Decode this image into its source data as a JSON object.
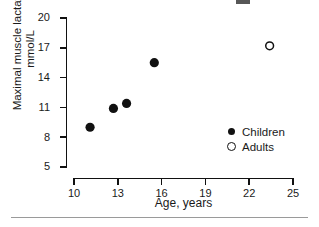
{
  "chart_data": {
    "type": "scatter",
    "title": "",
    "xlabel": "Age, years",
    "ylabel": "Maximal muscle lactate, mmol/L",
    "xlim": [
      10,
      25
    ],
    "ylim": [
      5,
      20
    ],
    "xticks": [
      10,
      13,
      16,
      19,
      22,
      25
    ],
    "yticks": [
      5,
      8,
      11,
      14,
      17,
      20
    ],
    "grid": false,
    "legend_position": "inside-lower-right",
    "series": [
      {
        "name": "Children",
        "marker": "filled-circle",
        "color": "#111111",
        "points": [
          {
            "x": 11.1,
            "y": 9.0
          },
          {
            "x": 12.7,
            "y": 10.9
          },
          {
            "x": 13.6,
            "y": 11.4
          },
          {
            "x": 15.5,
            "y": 15.5
          }
        ]
      },
      {
        "name": "Adults",
        "marker": "open-circle",
        "color": "#111111",
        "points": [
          {
            "x": 23.4,
            "y": 17.2
          }
        ]
      }
    ]
  },
  "axes": {
    "y_title": "Maximal muscle lactate, mmol/L",
    "x_title": "Age, years",
    "y_tick_labels": [
      "20",
      "17",
      "14",
      "11",
      "8",
      "5"
    ],
    "x_tick_labels": [
      "10",
      "13",
      "16",
      "19",
      "22",
      "25"
    ]
  },
  "legend": {
    "items": [
      {
        "label": "Children",
        "marker": "filled-circle"
      },
      {
        "label": "Adults",
        "marker": "open-circle"
      }
    ]
  }
}
